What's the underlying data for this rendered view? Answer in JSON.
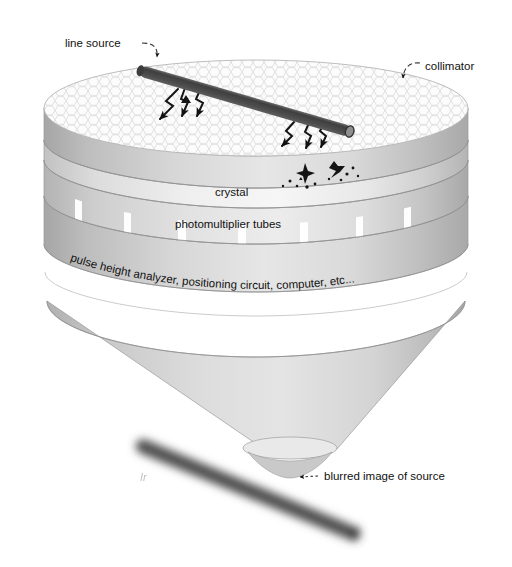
{
  "figure": {
    "background_color": "#ffffff",
    "width": 512,
    "height": 567
  },
  "labels": {
    "line_source": "line source",
    "collimator": "collimator",
    "crystal": "crystal",
    "photomultiplier_tubes": "photomultiplier tubes",
    "electronics": "pulse height analyzer, positioning circuit, computer, etc...",
    "blurred_image": "blurred image of source"
  },
  "components": [
    {
      "id": "line-source-rod",
      "name": "line source",
      "shape": "cylindrical rod",
      "color": "#4a4a4a",
      "position": "above collimator, tilted down-right"
    },
    {
      "id": "collimator-disc",
      "name": "collimator",
      "shape": "cylinder with hexagonal honeycomb top face",
      "top_face_color": "#fbfbfb",
      "hex_line_color": "#d8d8d8",
      "side_color": "#c9c9c9"
    },
    {
      "id": "crystal-band",
      "name": "crystal",
      "shape": "cylindrical band",
      "color": "#eeeeee"
    },
    {
      "id": "pmt-band",
      "name": "photomultiplier tubes",
      "shape": "cylindrical band with vertical tube separations",
      "color": "#d5d5d5",
      "stripe_color": "#ffffff",
      "stripe_count": 7
    },
    {
      "id": "electronics-band",
      "name": "pulse height analyzer, positioning circuit, computer, etc...",
      "shape": "cylindrical band",
      "color": "#d2d2d2"
    },
    {
      "id": "funnel-cone",
      "name": "funnel cone",
      "shape": "inverted cone tapering to point",
      "color": "#c6c6c6"
    },
    {
      "id": "blurred-image-rod",
      "name": "blurred image of source",
      "shape": "blurred cylindrical rod",
      "color": "#4d4d4d",
      "blur": "soft edges"
    }
  ],
  "annotations": [
    {
      "id": "gamma-rays-left",
      "name": "gamma ray zigzag arrows",
      "count": 3,
      "direction": "downward"
    },
    {
      "id": "gamma-rays-right",
      "name": "gamma ray zigzag arrows",
      "count": 3,
      "direction": "downward"
    },
    {
      "id": "scintillation-left",
      "name": "scintillation light burst",
      "count": 1
    },
    {
      "id": "scintillation-right",
      "name": "scintillation light burst",
      "count": 1
    }
  ],
  "colors": {
    "text": "#111111",
    "rod": "#4a4a4a",
    "rod_cap": "#8e8e8e",
    "outline": "#8a8a8a",
    "body_light": "#e8e8e8",
    "body_mid": "#cccccc",
    "body_dark": "#a8a8a8"
  }
}
